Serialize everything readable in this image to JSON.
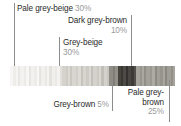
{
  "figure": {
    "type": "palette-proportion-bar",
    "background": "#ffffff"
  },
  "callouts": [
    {
      "id": "pale-grey-beige",
      "name": "Pale grey-beige",
      "percent": "30%",
      "align": "left",
      "lines": [
        "Pale grey-beige 30%"
      ]
    },
    {
      "id": "dark-grey-brown",
      "name": "Dark grey-brown",
      "percent": "10%",
      "align": "right",
      "lines": [
        "Dark grey-brown",
        "10%"
      ]
    },
    {
      "id": "grey-beige",
      "name": "Grey-beige",
      "percent": "30%",
      "align": "left",
      "lines": [
        "Grey-beige",
        "30%"
      ]
    },
    {
      "id": "grey-brown",
      "name": "Grey-brown",
      "percent": "5%",
      "align": "right",
      "lines": [
        "Grey-brown 5%"
      ]
    },
    {
      "id": "pale-grey-brown",
      "name": "Pale grey-brown",
      "percent": "25%",
      "align": "right",
      "lines": [
        "Pale grey-",
        "brown",
        "25%"
      ]
    }
  ],
  "chart_data": {
    "type": "bar",
    "title": "",
    "xlabel": "",
    "ylabel": "",
    "categories": [
      "Pale grey-beige",
      "Grey-beige",
      "Grey-brown",
      "Dark grey-brown",
      "Pale grey-brown"
    ],
    "values": [
      30,
      30,
      5,
      10,
      25
    ],
    "value_labels": [
      "30%",
      "30%",
      "5%",
      "10%",
      "25%"
    ],
    "unit": "percent",
    "swatch_colors": [
      "#f2f0ed",
      "#d9d6d1",
      "#8a8782",
      "#4a4743",
      "#a39f99"
    ],
    "legend_position": "callouts",
    "grid": false
  },
  "text_colors": {
    "label": "#2b2b2b",
    "percent": "#9a9a9a",
    "leader_line": "#8c8c8c"
  },
  "bar_stripes": [
    {
      "color": "#f7f6f4",
      "w": 3
    },
    {
      "color": "#efedea",
      "w": 2
    },
    {
      "color": "#f6f5f3",
      "w": 2
    },
    {
      "color": "#e9e7e3",
      "w": 2
    },
    {
      "color": "#f4f2f0",
      "w": 3
    },
    {
      "color": "#ecebe7",
      "w": 2
    },
    {
      "color": "#f7f6f4",
      "w": 2
    },
    {
      "color": "#e7e5e1",
      "w": 2
    },
    {
      "color": "#f3f1ef",
      "w": 3
    },
    {
      "color": "#eeece9",
      "w": 2
    },
    {
      "color": "#f8f7f5",
      "w": 2
    },
    {
      "color": "#e6e4e0",
      "w": 2
    },
    {
      "color": "#f2f0ed",
      "w": 3
    },
    {
      "color": "#eae8e4",
      "w": 2
    },
    {
      "color": "#f6f4f2",
      "w": 2
    },
    {
      "color": "#e4e2dd",
      "w": 2
    },
    {
      "color": "#f1efec",
      "w": 3
    },
    {
      "color": "#ebe9e5",
      "w": 2
    },
    {
      "color": "#f5f3f1",
      "w": 2
    },
    {
      "color": "#e2dfda",
      "w": 2
    },
    {
      "color": "#d6d3ce",
      "w": 3
    },
    {
      "color": "#cfccc6",
      "w": 2
    },
    {
      "color": "#dcd9d4",
      "w": 2
    },
    {
      "color": "#cac7c1",
      "w": 2
    },
    {
      "color": "#d9d6d1",
      "w": 3
    },
    {
      "color": "#d1cec8",
      "w": 2
    },
    {
      "color": "#dedbd6",
      "w": 2
    },
    {
      "color": "#c6c3bd",
      "w": 2
    },
    {
      "color": "#d8d5d0",
      "w": 3
    },
    {
      "color": "#cecbc5",
      "w": 2
    },
    {
      "color": "#dbd8d3",
      "w": 2
    },
    {
      "color": "#c4c1bb",
      "w": 2
    },
    {
      "color": "#d5d2cd",
      "w": 3
    },
    {
      "color": "#ccc9c3",
      "w": 2
    },
    {
      "color": "#dad7d2",
      "w": 2
    },
    {
      "color": "#c2bfb9",
      "w": 2
    },
    {
      "color": "#d4d1cc",
      "w": 3
    },
    {
      "color": "#c9c6c0",
      "w": 2
    },
    {
      "color": "#8f8c86",
      "w": 3
    },
    {
      "color": "#807d77",
      "w": 2
    },
    {
      "color": "#939089",
      "w": 2
    },
    {
      "color": "#474440",
      "w": 3
    },
    {
      "color": "#3a3733",
      "w": 2
    },
    {
      "color": "#4e4b47",
      "w": 2
    },
    {
      "color": "#343230",
      "w": 2
    },
    {
      "color": "#4a4743",
      "w": 3
    },
    {
      "color": "#3d3a37",
      "w": 2
    },
    {
      "color": "#52504b",
      "w": 2
    },
    {
      "color": "#a6a29c",
      "w": 3
    },
    {
      "color": "#98948e",
      "w": 2
    },
    {
      "color": "#aba7a1",
      "w": 2
    },
    {
      "color": "#918d87",
      "w": 2
    },
    {
      "color": "#a4a09a",
      "w": 3
    },
    {
      "color": "#9b9791",
      "w": 2
    },
    {
      "color": "#aeaaa4",
      "w": 2
    },
    {
      "color": "#8e8a84",
      "w": 2
    },
    {
      "color": "#a29e98",
      "w": 3
    },
    {
      "color": "#97938d",
      "w": 2
    },
    {
      "color": "#a9a59f",
      "w": 2
    },
    {
      "color": "#8b8781",
      "w": 2
    },
    {
      "color": "#a09c96",
      "w": 3
    },
    {
      "color": "#949089",
      "w": 2
    },
    {
      "color": "#a7a39d",
      "w": 2
    }
  ]
}
